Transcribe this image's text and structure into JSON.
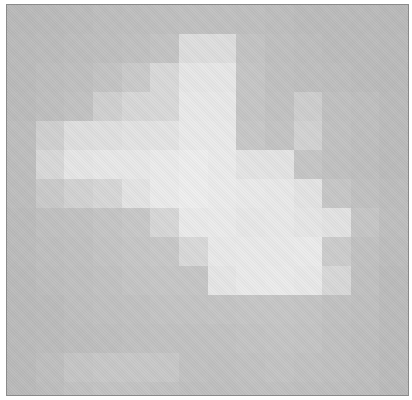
{
  "image": {
    "description": "Low-resolution grayscale pixelated image (blocky bright blob on gray background)",
    "grid": {
      "cols": 14,
      "rows": 14,
      "cell_width": 28.65,
      "cell_height": 29,
      "gray_min": "#b4b4b4",
      "gray_max": "#f0f0f0"
    },
    "intensity": [
      [
        10,
        12,
        14,
        16,
        18,
        20,
        22,
        22,
        20,
        16,
        14,
        14,
        12,
        10
      ],
      [
        12,
        14,
        16,
        18,
        22,
        26,
        70,
        70,
        26,
        20,
        16,
        14,
        14,
        12
      ],
      [
        12,
        16,
        20,
        26,
        36,
        62,
        85,
        85,
        30,
        22,
        18,
        16,
        14,
        12
      ],
      [
        14,
        18,
        24,
        46,
        60,
        62,
        88,
        88,
        30,
        24,
        44,
        22,
        18,
        14
      ],
      [
        16,
        46,
        72,
        74,
        78,
        80,
        90,
        90,
        34,
        26,
        50,
        24,
        18,
        14
      ],
      [
        16,
        60,
        84,
        86,
        86,
        92,
        96,
        92,
        80,
        80,
        30,
        22,
        18,
        14
      ],
      [
        16,
        36,
        50,
        58,
        80,
        92,
        96,
        94,
        90,
        88,
        80,
        32,
        22,
        16
      ],
      [
        14,
        22,
        24,
        28,
        34,
        58,
        90,
        92,
        86,
        88,
        84,
        78,
        30,
        18
      ],
      [
        14,
        18,
        22,
        26,
        30,
        34,
        62,
        88,
        90,
        90,
        92,
        40,
        24,
        16
      ],
      [
        12,
        16,
        20,
        24,
        28,
        30,
        30,
        84,
        90,
        92,
        88,
        60,
        22,
        14
      ],
      [
        12,
        14,
        18,
        22,
        24,
        26,
        26,
        28,
        30,
        30,
        28,
        24,
        20,
        14
      ],
      [
        12,
        14,
        16,
        18,
        22,
        24,
        24,
        24,
        26,
        28,
        26,
        22,
        18,
        14
      ],
      [
        12,
        18,
        30,
        34,
        34,
        34,
        24,
        22,
        24,
        26,
        24,
        22,
        18,
        14
      ],
      [
        12,
        16,
        24,
        26,
        26,
        24,
        20,
        20,
        22,
        22,
        20,
        18,
        16,
        12
      ]
    ]
  }
}
